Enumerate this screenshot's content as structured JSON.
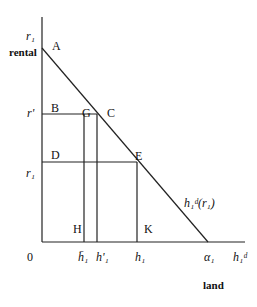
{
  "diagram": {
    "type": "land-rental-demand",
    "y_axis": {
      "top_label": "r₁",
      "label": "rental",
      "ticks": [
        {
          "id": "r_prime",
          "label": "r'"
        },
        {
          "id": "r1",
          "label": "r₁"
        }
      ]
    },
    "x_axis": {
      "origin_label": "0",
      "end_label": "h₁ᵈ",
      "label": "land",
      "ticks": [
        {
          "id": "h1_bar",
          "label": "h̄₁"
        },
        {
          "id": "h1_prime",
          "label": "h'₁"
        },
        {
          "id": "h1",
          "label": "h₁"
        },
        {
          "id": "alpha1",
          "label": "α₁"
        }
      ]
    },
    "demand_curve_label": "h₁ᵈ(r₁)",
    "points": {
      "A": "A",
      "B": "B",
      "G": "G",
      "C": "C",
      "D": "D",
      "E": "E",
      "H": "H",
      "K": "K"
    }
  }
}
